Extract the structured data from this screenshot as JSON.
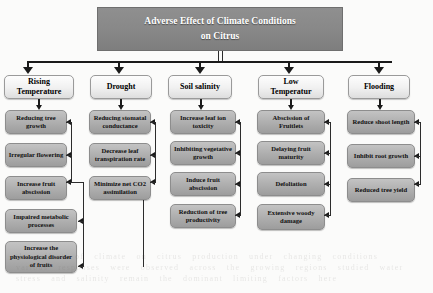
{
  "diagram": {
    "title": {
      "line1": "Adverse Effect of Climate Conditions",
      "line2": "on Citrus"
    },
    "columns": [
      {
        "header": "Rising Temperature",
        "header_line1": "Rising",
        "header_line2": "Temperature",
        "nodes": [
          "Reducing tree growth",
          "Irregular flowering",
          "Increase fruit abscission",
          "Impaired metabolic processes",
          "Increase the physiological disorder of fruits"
        ]
      },
      {
        "header": "Drought",
        "header_line1": "Drought",
        "header_line2": "",
        "nodes": [
          "Reducing stomatal conductance",
          "Decrease leaf transpiration rate",
          "Minimize net CO2 assimilation"
        ]
      },
      {
        "header": "Soil salinity",
        "header_line1": "Soil salinity",
        "header_line2": "",
        "nodes": [
          "Increase leaf ion toxicity",
          "Inhibiting vegetative growth",
          "Induce fruit abscission",
          "Reduction of tree productivity"
        ]
      },
      {
        "header": "Low Temperatur",
        "header_line1": "Low",
        "header_line2": "Temperatur",
        "nodes": [
          "Abscission of Fruitlets",
          "Delaying fruit maturity",
          "Defoliation",
          "Extensive woody damage"
        ]
      },
      {
        "header": "Flooding",
        "header_line1": "Flooding",
        "header_line2": "",
        "nodes": [
          "Reduce shoot length",
          "Inhibit root growth",
          "Reduced tree yield"
        ]
      }
    ],
    "colors": {
      "title_fill": "#898989",
      "title_text": "#ffffff",
      "header_fill": "#f1f1f1",
      "node_fill": "#b0b0b0",
      "connector": "#1a1a1a",
      "background": "#fbfbfa"
    },
    "background_noise_text": "a faint bleed-through of printed text from the reverse side of the scanned page"
  }
}
